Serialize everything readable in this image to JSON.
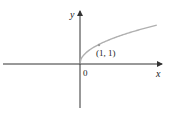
{
  "chart_data": {
    "type": "line",
    "title": "",
    "function": "y = sqrt(x)",
    "xlabel": "x",
    "ylabel": "y",
    "origin_label": "0",
    "annotations": [
      {
        "label": "(1, 1)",
        "x": 1,
        "y": 1
      }
    ],
    "series": [
      {
        "name": "y = √x",
        "x": [
          0,
          0.25,
          0.5,
          1,
          1.5,
          2,
          2.5,
          3,
          3.5,
          4
        ],
        "y": [
          0,
          0.5,
          0.707,
          1,
          1.225,
          1.414,
          1.581,
          1.732,
          1.871,
          2
        ]
      }
    ],
    "xlim": [
      -4.1,
      4.3
    ],
    "ylim": [
      -2.4,
      2.6
    ],
    "grid": false,
    "colors": {
      "axes": "#333333",
      "curve": "#b0b0b0",
      "point": "#999999"
    }
  },
  "labels": {
    "x": "x",
    "y": "y",
    "origin": "0",
    "point": "(1, 1)"
  }
}
